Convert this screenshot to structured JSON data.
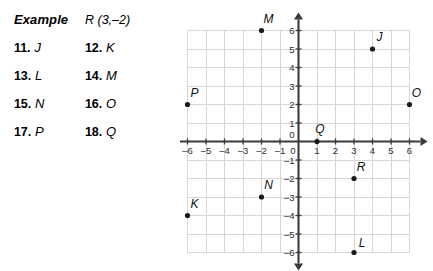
{
  "exercises": {
    "header": {
      "title": "Example",
      "value": "R (3,–2)"
    },
    "rows": [
      {
        "a_num": "11.",
        "a_label": "J",
        "b_num": "12.",
        "b_label": "K"
      },
      {
        "a_num": "13.",
        "a_label": "L",
        "b_num": "14.",
        "b_label": "M"
      },
      {
        "a_num": "15.",
        "a_label": "N",
        "b_num": "16.",
        "b_label": "O"
      },
      {
        "a_num": "17.",
        "a_label": "P",
        "b_num": "18.",
        "b_label": "Q"
      }
    ]
  },
  "chart_data": {
    "type": "scatter",
    "title": "",
    "xlabel": "",
    "ylabel": "",
    "xlim": [
      -6,
      6
    ],
    "ylim": [
      -6,
      6
    ],
    "grid": true,
    "legend": "none",
    "x_ticks": [
      "–6",
      "–5",
      "–4",
      "–3",
      "–2",
      "–1",
      "0",
      "1",
      "2",
      "3",
      "4",
      "5",
      "6"
    ],
    "x_tick_values": [
      -6,
      -5,
      -4,
      -3,
      -2,
      -1,
      0,
      1,
      2,
      3,
      4,
      5,
      6
    ],
    "y_ticks": [
      "6",
      "5",
      "4",
      "3",
      "2",
      "1",
      "0",
      "–1",
      "–2",
      "–3",
      "–4",
      "–5",
      "–6"
    ],
    "y_tick_values": [
      6,
      5,
      4,
      3,
      2,
      1,
      0,
      -1,
      -2,
      -3,
      -4,
      -5,
      -6
    ],
    "points": [
      {
        "label": "M",
        "x": -2,
        "y": 6,
        "lx": 7,
        "ly": -8
      },
      {
        "label": "J",
        "x": 4,
        "y": 5,
        "lx": 7,
        "ly": -8
      },
      {
        "label": "P",
        "x": -6,
        "y": 2,
        "lx": 7,
        "ly": -8
      },
      {
        "label": "O",
        "x": 6,
        "y": 2,
        "lx": 7,
        "ly": -8
      },
      {
        "label": "Q",
        "x": 1,
        "y": 0,
        "lx": 3,
        "ly": -9
      },
      {
        "label": "R",
        "x": 3,
        "y": -2,
        "lx": 7,
        "ly": -8
      },
      {
        "label": "N",
        "x": -2,
        "y": -3,
        "lx": 7,
        "ly": -8
      },
      {
        "label": "K",
        "x": -6,
        "y": -4,
        "lx": 7,
        "ly": -8
      },
      {
        "label": "L",
        "x": 3,
        "y": -6,
        "lx": 8,
        "ly": -6
      }
    ]
  },
  "colors": {
    "grid": "#d6d6d6",
    "axis": "#3a3a3a",
    "point": "#1a1a1a",
    "text": "#111111",
    "background": "#ffffff"
  }
}
